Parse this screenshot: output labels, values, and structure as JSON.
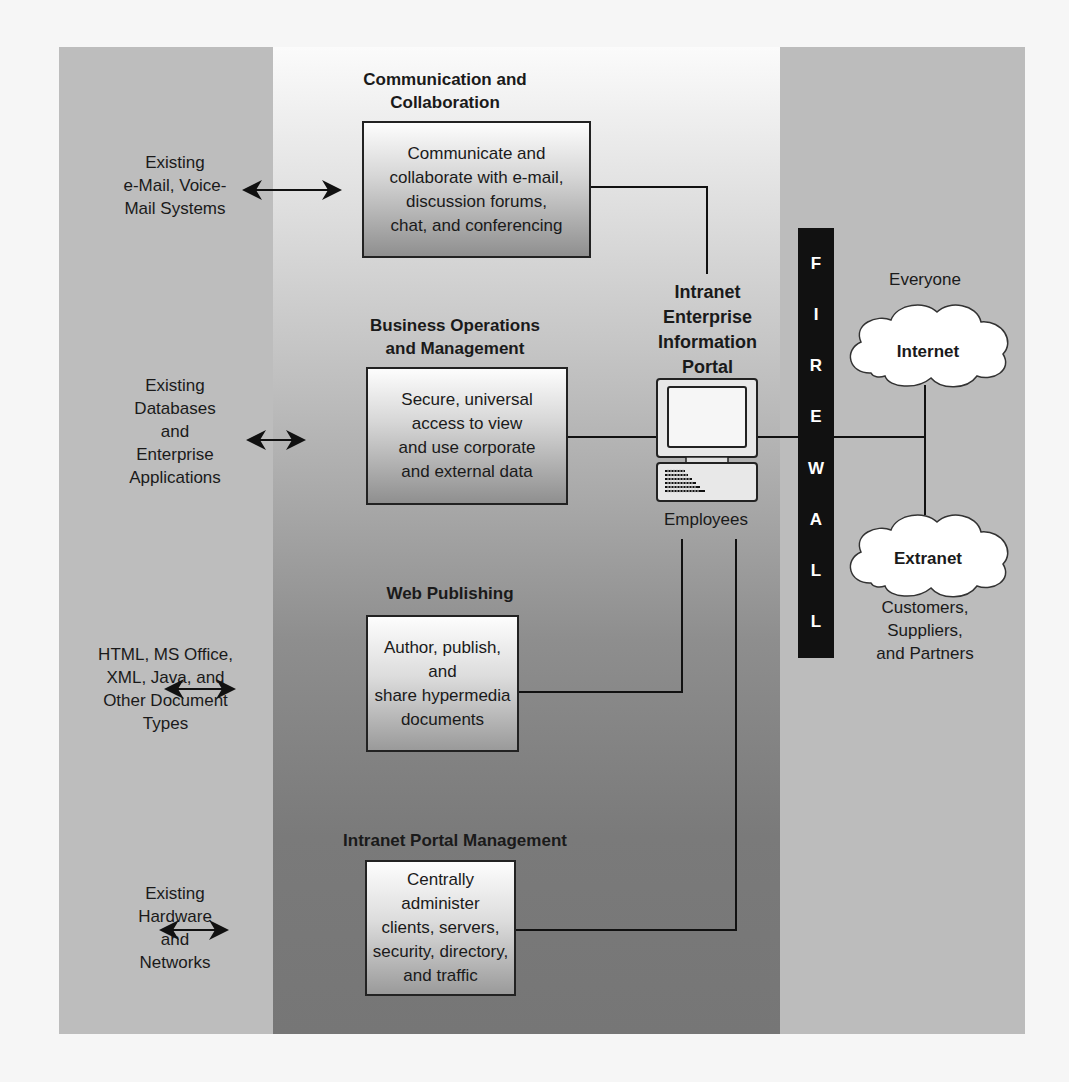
{
  "diagram": {
    "left_column": [
      {
        "id": "email",
        "text": "Existing\ne-Mail, Voice-\nMail Systems"
      },
      {
        "id": "databases",
        "text": "Existing\nDatabases\nand\nEnterprise\nApplications"
      },
      {
        "id": "documents",
        "text": "HTML, MS Office,\nXML, Java, and\nOther Document\nTypes"
      },
      {
        "id": "hardware",
        "text": "Existing\nHardware\nand\nNetworks"
      }
    ],
    "modules": [
      {
        "id": "comm",
        "title": "Communication and\nCollaboration",
        "body": "Communicate and\ncollaborate with e-mail,\ndiscussion forums,\nchat, and conferencing"
      },
      {
        "id": "business",
        "title": "Business Operations\nand Management",
        "body": "Secure, universal\naccess to view\nand use corporate\nand external data"
      },
      {
        "id": "web",
        "title": "Web Publishing",
        "body": "Author, publish, and\nshare hypermedia\ndocuments"
      },
      {
        "id": "portal_mgmt",
        "title": "Intranet Portal Management",
        "body": "Centrally administer\nclients, servers,\nsecurity, directory,\nand traffic"
      }
    ],
    "portal": {
      "title": "Intranet\nEnterprise\nInformation\nPortal",
      "caption": "Employees"
    },
    "firewall": {
      "letters": [
        "F",
        "I",
        "R",
        "E",
        "W",
        "A",
        "L",
        "L"
      ]
    },
    "internet": {
      "label": "Internet",
      "caption": "Everyone"
    },
    "extranet": {
      "label": "Extranet",
      "caption": "Customers,\nSuppliers,\nand Partners"
    },
    "colors": {
      "side_band": "#bdbdbd",
      "firewall": "#111111",
      "cloud": "#ffffff",
      "line": "#111111"
    }
  }
}
